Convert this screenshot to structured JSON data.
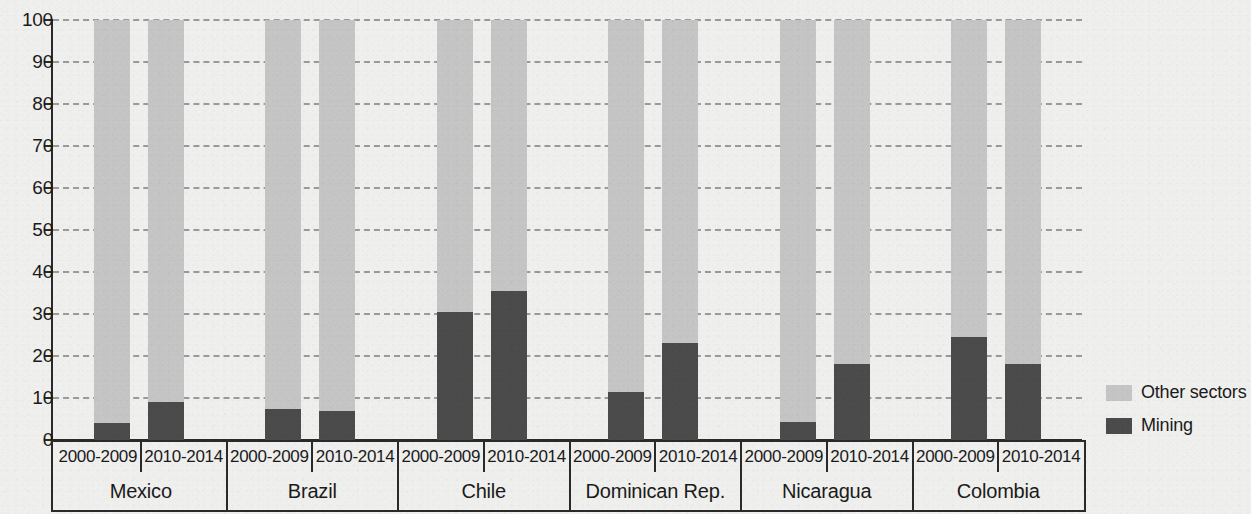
{
  "chart_data": {
    "type": "bar",
    "subtype": "stacked-100-percent",
    "title": "",
    "subtitle": "",
    "xlabel": "",
    "ylabel": "",
    "ylim": [
      0,
      100
    ],
    "y_ticks": [
      0,
      10,
      20,
      30,
      40,
      50,
      60,
      70,
      80,
      90,
      100
    ],
    "y_tick_labels": [
      "0",
      "10",
      "20",
      "30",
      "40",
      "50",
      "60",
      "70",
      "80",
      "90",
      "100"
    ],
    "grid": true,
    "grid_style": "dashed-horizontal",
    "legend_position": "right",
    "categories": [
      "Mexico 2000-2009",
      "Mexico 2010-2014",
      "Brazil 2000-2009",
      "Brazil 2010-2014",
      "Chile 2000-2009",
      "Chile 2010-2014",
      "Dominican Rep. 2000-2009",
      "Dominican Rep. 2010-2014",
      "Nicaragua 2000-2009",
      "Nicaragua 2010-2014",
      "Colombia 2000-2009",
      "Colombia 2010-2014"
    ],
    "series": [
      {
        "name": "Other sectors",
        "color": "#c5c5c5",
        "values": [
          96.0,
          91.0,
          92.6,
          93.0,
          69.5,
          64.5,
          88.6,
          77.0,
          95.7,
          81.8,
          75.5,
          82.0
        ]
      },
      {
        "name": "Mining",
        "color": "#4b4b4b",
        "values": [
          4.0,
          9.0,
          7.4,
          7.0,
          30.5,
          35.5,
          11.4,
          23.0,
          4.3,
          18.2,
          24.5,
          18.0
        ]
      }
    ],
    "groups": [
      {
        "country": "Mexico",
        "periods": [
          {
            "label": "2000-2009",
            "mining": 4.0,
            "other": 96.0
          },
          {
            "label": "2010-2014",
            "mining": 9.0,
            "other": 91.0
          }
        ]
      },
      {
        "country": "Brazil",
        "periods": [
          {
            "label": "2000-2009",
            "mining": 7.4,
            "other": 92.6
          },
          {
            "label": "2010-2014",
            "mining": 7.0,
            "other": 93.0
          }
        ]
      },
      {
        "country": "Chile",
        "periods": [
          {
            "label": "2000-2009",
            "mining": 30.5,
            "other": 69.5
          },
          {
            "label": "2010-2014",
            "mining": 35.5,
            "other": 64.5
          }
        ]
      },
      {
        "country": "Dominican Rep.",
        "periods": [
          {
            "label": "2000-2009",
            "mining": 11.4,
            "other": 88.6
          },
          {
            "label": "2010-2014",
            "mining": 23.0,
            "other": 77.0
          }
        ]
      },
      {
        "country": "Nicaragua",
        "periods": [
          {
            "label": "2000-2009",
            "mining": 4.3,
            "other": 95.7
          },
          {
            "label": "2010-2014",
            "mining": 18.2,
            "other": 81.8
          }
        ]
      },
      {
        "country": "Colombia",
        "periods": [
          {
            "label": "2000-2009",
            "mining": 24.5,
            "other": 75.5
          },
          {
            "label": "2010-2014",
            "mining": 18.0,
            "other": 82.0
          }
        ]
      }
    ]
  },
  "legend": {
    "items": [
      {
        "label": "Other sectors",
        "color": "#c5c5c5",
        "swatch_name": "other-sectors-swatch"
      },
      {
        "label": "Mining",
        "color": "#4b4b4b",
        "swatch_name": "mining-swatch"
      }
    ]
  },
  "colors": {
    "background": "#efefed",
    "axis": "#2a2a2a",
    "gridline": "#9a9a9a",
    "other_sectors": "#c5c5c5",
    "mining": "#4b4b4b",
    "text": "#1b1b1b"
  }
}
